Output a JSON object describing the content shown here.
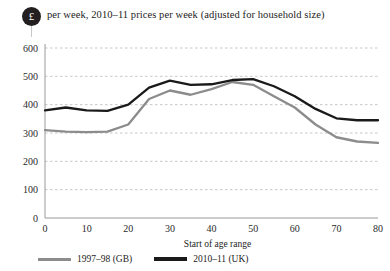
{
  "header": {
    "badge_symbol": "£",
    "badge_name": "pound-sterling-icon",
    "title": "per week, 2010–11 prices per week (adjusted for household size)"
  },
  "legend": {
    "position": "bottom-left",
    "items": [
      {
        "label": "1997–98 (GB)",
        "color": "#8c8c8c"
      },
      {
        "label": "2010–11 (UK)",
        "color": "#1a1a1a"
      }
    ]
  },
  "chart_data": {
    "type": "line",
    "title": "per week, 2010–11 prices per week (adjusted for household size)",
    "xlabel": "Start of age range",
    "ylabel": "",
    "xlim": [
      0,
      80
    ],
    "ylim": [
      0,
      600
    ],
    "xticks": [
      0,
      10,
      20,
      30,
      40,
      50,
      60,
      70,
      80
    ],
    "yticks": [
      0,
      100,
      200,
      300,
      400,
      500,
      600
    ],
    "grid": true,
    "grid_style": "dotted-horizontal",
    "x": [
      0,
      5,
      10,
      15,
      20,
      25,
      30,
      35,
      40,
      45,
      50,
      55,
      60,
      65,
      70,
      75,
      80
    ],
    "series": [
      {
        "name": "1997–98 (GB)",
        "color": "#8c8c8c",
        "values": [
          310,
          305,
          303,
          305,
          330,
          420,
          450,
          435,
          455,
          480,
          470,
          430,
          390,
          330,
          285,
          270,
          265
        ]
      },
      {
        "name": "2010–11 (UK)",
        "color": "#1a1a1a",
        "values": [
          380,
          390,
          380,
          378,
          400,
          460,
          485,
          470,
          472,
          487,
          490,
          465,
          430,
          385,
          352,
          345,
          345
        ]
      }
    ]
  }
}
